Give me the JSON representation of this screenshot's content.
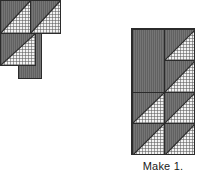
{
  "diagram": {
    "caption": "Make 1.",
    "colors": {
      "dark_fabric": "#6e6e6e",
      "light_fabric": "#f2f2f2",
      "seam_line": "#2b2b2b",
      "background": "#ffffff",
      "text": "#1a1a1a"
    },
    "components": [
      {
        "id": "piece-rect",
        "name": "solid-rectangle-unit",
        "label": "",
        "patch_type": "rectangle",
        "fabric": "dark",
        "columns": 1,
        "rows": 2
      },
      {
        "id": "piece-col",
        "name": "hst-column-unit",
        "label": "",
        "patch_type": "half-square-triangle-column",
        "columns": 1,
        "rows": 2,
        "cells": [
          {
            "dark_corner": "upper-left",
            "light_corner": "lower-right"
          },
          {
            "dark_corner": "upper-left",
            "light_corner": "lower-right"
          }
        ]
      },
      {
        "id": "piece-rowA",
        "name": "hst-row-unit-a",
        "label": "",
        "patch_type": "half-square-triangle-row",
        "columns": 2,
        "rows": 1,
        "cells": [
          {
            "dark_corner": "upper-left",
            "light_corner": "lower-right"
          },
          {
            "dark_corner": "upper-left",
            "light_corner": "lower-right"
          }
        ]
      },
      {
        "id": "piece-rowB",
        "name": "hst-row-unit-b",
        "label": "",
        "patch_type": "half-square-triangle-row",
        "columns": 2,
        "rows": 1,
        "cells": [
          {
            "dark_corner": "upper-left",
            "light_corner": "lower-right"
          },
          {
            "dark_corner": "upper-left",
            "light_corner": "lower-right"
          }
        ]
      }
    ],
    "assembled_block": {
      "name": "assembled-quilt-block",
      "columns": 2,
      "rows": 4,
      "units": [
        {
          "position": "r0-r1 c0",
          "type": "solid-rectangle",
          "fabric": "dark",
          "spans_rows": 2
        },
        {
          "position": "r0 c1",
          "type": "half-square-triangle",
          "dark_corner": "upper-left",
          "light_corner": "lower-right"
        },
        {
          "position": "r1 c1",
          "type": "half-square-triangle",
          "dark_corner": "upper-left",
          "light_corner": "lower-right"
        },
        {
          "position": "r2 c0",
          "type": "half-square-triangle",
          "dark_corner": "upper-left",
          "light_corner": "lower-right"
        },
        {
          "position": "r2 c1",
          "type": "half-square-triangle",
          "dark_corner": "upper-left",
          "light_corner": "lower-right"
        },
        {
          "position": "r3 c0",
          "type": "half-square-triangle",
          "dark_corner": "upper-left",
          "light_corner": "lower-right"
        },
        {
          "position": "r3 c1",
          "type": "half-square-triangle",
          "dark_corner": "upper-left",
          "light_corner": "lower-right"
        }
      ]
    }
  }
}
